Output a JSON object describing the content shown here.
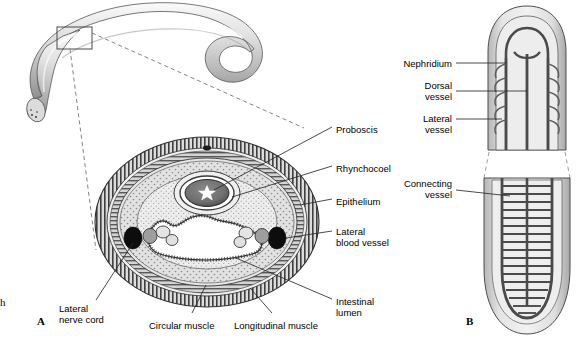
{
  "figure": {
    "panels": [
      {
        "id": "A",
        "letter": "A",
        "caption": "Cross section through body"
      },
      {
        "id": "B",
        "letter": "B",
        "caption": "Circulatory system, anterior and body region"
      }
    ],
    "edge_fragment": "h"
  },
  "labels_a": [
    {
      "name": "proboscis",
      "text": "Proboscis",
      "x": 336,
      "y": 124,
      "align": "left"
    },
    {
      "name": "rhynchocoel",
      "text": "Rhynchocoel",
      "x": 336,
      "y": 163,
      "align": "left"
    },
    {
      "name": "epithelium",
      "text": "Epithelium",
      "x": 336,
      "y": 196,
      "align": "left"
    },
    {
      "name": "lateral-blood-vessel",
      "text": "Lateral\nblood vessel",
      "x": 336,
      "y": 226,
      "align": "left"
    },
    {
      "name": "intestinal-lumen",
      "text": "Intestinal\nlumen",
      "x": 336,
      "y": 296,
      "align": "left"
    },
    {
      "name": "lateral-nerve-cord",
      "text": "Lateral\nnerve cord",
      "x": 59,
      "y": 303,
      "align": "left"
    },
    {
      "name": "circular-muscle",
      "text": "Circular muscle",
      "x": 149,
      "y": 320,
      "align": "left"
    },
    {
      "name": "longitudinal-muscle",
      "text": "Longitudinal muscle",
      "x": 234,
      "y": 320,
      "align": "left"
    }
  ],
  "labels_b": [
    {
      "name": "nephridium",
      "text": "Nephridium",
      "x": 452,
      "y": 66,
      "align": "right"
    },
    {
      "name": "dorsal-vessel",
      "text": "Dorsal\nvessel",
      "x": 452,
      "y": 88,
      "align": "right"
    },
    {
      "name": "lateral-vessel",
      "text": "Lateral\nvessel",
      "x": 452,
      "y": 121,
      "align": "right"
    },
    {
      "name": "connecting-vessel",
      "text": "Connecting\nvessel",
      "x": 452,
      "y": 186,
      "align": "right"
    }
  ],
  "colors": {
    "ink": "#1a1a1a",
    "outline": "#3d3d3d",
    "tissue_light": "#e8e8e8",
    "tissue_mid": "#c9c9c9",
    "tissue_dark": "#9a9a9a",
    "hatch": "#4a4a4a",
    "solid_black": "#0d0d0d",
    "background": "#ffffff",
    "leader": "#2a2a2a"
  },
  "structure": {
    "whole_worm": {
      "name": "ribbon-worm-body",
      "inset_box": {
        "x": 57,
        "y": 27,
        "w": 35,
        "h": 22
      }
    },
    "cross_section": {
      "name": "body-cross-section",
      "center": {
        "x": 207,
        "y": 222
      },
      "layers": [
        "epidermis",
        "circular muscle",
        "longitudinal muscle",
        "parenchyma",
        "gut"
      ],
      "nerve_cords": 2,
      "lateral_vessels": 2,
      "proboscis_lumen": "star-shaped"
    },
    "circulatory": {
      "name": "circulatory-system",
      "anterior_loop": true,
      "connecting_vessel_count": 19
    }
  }
}
